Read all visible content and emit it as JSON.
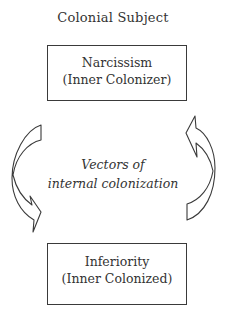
{
  "diagram": {
    "title": "Colonial Subject",
    "top_box": {
      "line1": "Narcissism",
      "line2": "(Inner Colonizer)"
    },
    "bottom_box": {
      "line1": "Inferiority",
      "line2": "(Inner Colonized)"
    },
    "center_label": {
      "line1": "Vectors of",
      "line2": "internal colonization"
    },
    "arrows": [
      {
        "side": "left",
        "direction": "down",
        "shape": "curved-arrow"
      },
      {
        "side": "right",
        "direction": "up",
        "shape": "curved-arrow"
      }
    ],
    "colors": {
      "stroke": "#3a3a3a",
      "text": "#333333",
      "background": "#ffffff"
    }
  }
}
